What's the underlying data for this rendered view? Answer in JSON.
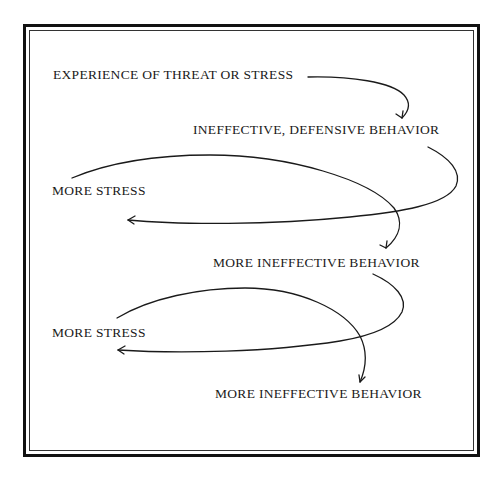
{
  "figure": {
    "top_cutoff_text": "",
    "nodes": [
      {
        "id": "experience",
        "label": "EXPERIENCE OF THREAT OR STRESS"
      },
      {
        "id": "ineffective-defensive",
        "label": "INEFFECTIVE, DEFENSIVE BEHAVIOR"
      },
      {
        "id": "more-stress-1",
        "label": "MORE STRESS"
      },
      {
        "id": "more-ineffective-1",
        "label": "MORE INEFFECTIVE BEHAVIOR"
      },
      {
        "id": "more-stress-2",
        "label": "MORE STRESS"
      },
      {
        "id": "more-ineffective-2",
        "label": "MORE INEFFECTIVE BEHAVIOR"
      }
    ],
    "edges": [
      {
        "from": "experience",
        "to": "ineffective-defensive"
      },
      {
        "from": "ineffective-defensive",
        "to": "more-stress-1"
      },
      {
        "from": "more-stress-1",
        "to": "more-ineffective-1"
      },
      {
        "from": "more-ineffective-1",
        "to": "more-stress-2"
      },
      {
        "from": "more-stress-2",
        "to": "more-ineffective-2"
      }
    ],
    "colors": {
      "ink": "#1a1a1a",
      "frame": "#111111",
      "background": "#ffffff"
    }
  }
}
